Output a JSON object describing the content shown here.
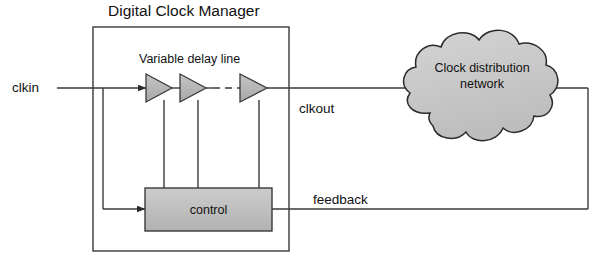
{
  "diagram": {
    "title": "Digital Clock Manager",
    "blocks": {
      "dcm_box": {
        "label": "Digital Clock Manager"
      },
      "delay_line": {
        "label": "Variable delay line",
        "stage_count": 3
      },
      "control": {
        "label": "control",
        "fill": "#bdbdbd"
      },
      "cloud": {
        "line1": "Clock distribution",
        "line2": "network",
        "fill": "#c9c9c9"
      }
    },
    "signals": {
      "clkin": "clkin",
      "clkout": "clkout",
      "feedback": "feedback"
    },
    "colors": {
      "line": "#3a3a3a",
      "text": "#111111",
      "background": "#ffffff",
      "buffer_fill": "#b5b5b5",
      "control_fill": "#bdbdbd",
      "cloud_fill": "#c9c9c9"
    }
  }
}
